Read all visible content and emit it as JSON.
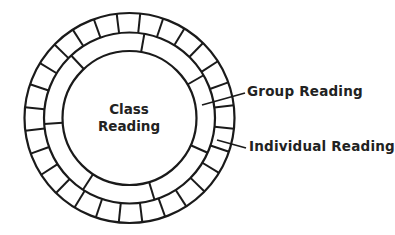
{
  "diagram": {
    "type": "concentric-rings",
    "center_label": {
      "line1": "Class",
      "line2": "Reading"
    },
    "labels": {
      "group": "Group Reading",
      "individual": "Individual Reading"
    },
    "rings": [
      {
        "name": "Class Reading",
        "level": "inner circle",
        "segments": 1
      },
      {
        "name": "Group Reading",
        "level": "middle ring",
        "segments": 7
      },
      {
        "name": "Individual Reading",
        "level": "outer ring",
        "segments": 28
      }
    ],
    "stroke_color": "#1a1a1a",
    "text_color": "#222222"
  }
}
